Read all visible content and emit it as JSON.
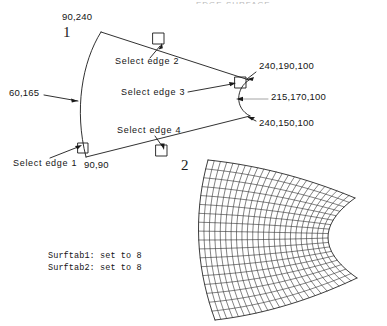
{
  "figure": {
    "title_sliver": "EDGE SURFACE",
    "background_color": "#ffffff",
    "line_color": "#1a1a1a"
  },
  "labels": {
    "coord_top_left": "90,240",
    "coord_left_mid": "60,165",
    "coord_bottom_left": "90,90",
    "coord_right_top": "240,190,100",
    "coord_right_mid": "215,170,100",
    "coord_right_bottom": "240,150,100",
    "step_one": "1",
    "step_two": "2",
    "select_edge_1": "Select edge 1",
    "select_edge_2": "Select edge 2",
    "select_edge_3": "Select edge 3",
    "select_edge_4": "Select edge 4",
    "surftab1": "Surftab1: set to 8",
    "surftab2": "Surftab2: set to 8"
  },
  "chart_data": {
    "type": "diagram",
    "title": "EDGE SURFACE",
    "annotations": [
      {
        "name": "coord-top-left",
        "text": "90,240",
        "x": 62,
        "y": 18
      },
      {
        "name": "coord-left-mid",
        "text": "60,165",
        "x": 10,
        "y": 93
      },
      {
        "name": "coord-bottom-left",
        "text": "90,90",
        "x": 85,
        "y": 165
      },
      {
        "name": "coord-right-top",
        "text": "240,190,100",
        "x": 258,
        "y": 67
      },
      {
        "name": "coord-right-mid",
        "text": "215,170,100",
        "x": 270,
        "y": 97
      },
      {
        "name": "coord-right-bottom",
        "text": "240,150,100",
        "x": 258,
        "y": 123
      },
      {
        "name": "select-edge-1",
        "text": "Select edge 1",
        "x": 13,
        "y": 163
      },
      {
        "name": "select-edge-2",
        "text": "Select edge 2",
        "x": 116,
        "y": 63
      },
      {
        "name": "select-edge-3",
        "text": "Select edge 3",
        "x": 122,
        "y": 95
      },
      {
        "name": "select-edge-4",
        "text": "Select edge 4",
        "x": 118,
        "y": 130
      },
      {
        "name": "step-one",
        "text": "1",
        "x": 64,
        "y": 28
      },
      {
        "name": "step-two",
        "text": "2",
        "x": 182,
        "y": 160
      },
      {
        "name": "surftab1",
        "text": "Surftab1: set to 8",
        "x": 48,
        "y": 253
      },
      {
        "name": "surftab2",
        "text": "Surftab2: set to 8",
        "x": 48,
        "y": 265
      }
    ],
    "mesh": {
      "u_divisions": 24,
      "v_divisions": 18,
      "description": "curved fan-shaped edge surface mesh, concave right boundary"
    },
    "pick_boxes": [
      {
        "name": "pick-box-edge-1",
        "x": 83,
        "y": 148
      },
      {
        "name": "pick-box-edge-2",
        "x": 158,
        "y": 38
      },
      {
        "name": "pick-box-edge-3",
        "x": 240,
        "y": 82
      },
      {
        "name": "pick-box-edge-4",
        "x": 161,
        "y": 150
      }
    ]
  }
}
